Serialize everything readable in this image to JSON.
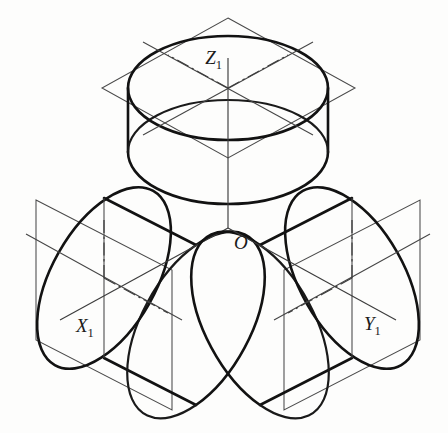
{
  "figure": {
    "background_color": "#fdfdfc",
    "outline_color": "#121212",
    "construction_color": "#454545",
    "origin_label": "O",
    "axes": [
      {
        "id": "z",
        "label": "Z",
        "subscript": "1",
        "direction": "up",
        "label_x": 222,
        "label_y": 64
      },
      {
        "id": "x",
        "label": "X",
        "subscript": "1",
        "direction": "down-left",
        "label_x": 76,
        "label_y": 332
      },
      {
        "id": "y",
        "label": "Y",
        "subscript": "1",
        "direction": "down-right",
        "label_x": 364,
        "label_y": 330
      }
    ],
    "origin": {
      "x": 228,
      "y": 228,
      "label_x": 234,
      "label_y": 249
    },
    "solids": [
      {
        "id": "cylinder-z",
        "axis": "Z1",
        "position": "top",
        "plane": "horizontal"
      },
      {
        "id": "cylinder-x",
        "axis": "X1",
        "position": "lower-left",
        "plane": "left-vertical"
      },
      {
        "id": "cylinder-y",
        "axis": "Y1",
        "position": "lower-right",
        "plane": "right-vertical"
      }
    ]
  }
}
